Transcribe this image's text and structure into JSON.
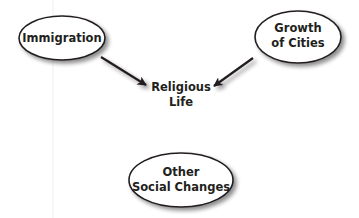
{
  "diagram": {
    "type": "concept-map",
    "center": {
      "lines": [
        "Religious",
        "Life"
      ]
    },
    "nodes": [
      {
        "id": "immigration",
        "lines": [
          "Immigration"
        ]
      },
      {
        "id": "growth-of-cities",
        "lines": [
          "Growth",
          "of Cities"
        ]
      },
      {
        "id": "other-social-changes",
        "lines": [
          "Other",
          "Social Changes"
        ]
      }
    ],
    "edges": [
      {
        "from": "immigration",
        "to": "religious-life"
      },
      {
        "from": "growth-of-cities",
        "to": "religious-life"
      },
      {
        "from": "other-social-changes",
        "to": "religious-life"
      }
    ],
    "colors": {
      "stroke": "#231f20",
      "fill": "#ffffff",
      "shadow": "#9a9a9a",
      "guide": "#ececec"
    }
  }
}
